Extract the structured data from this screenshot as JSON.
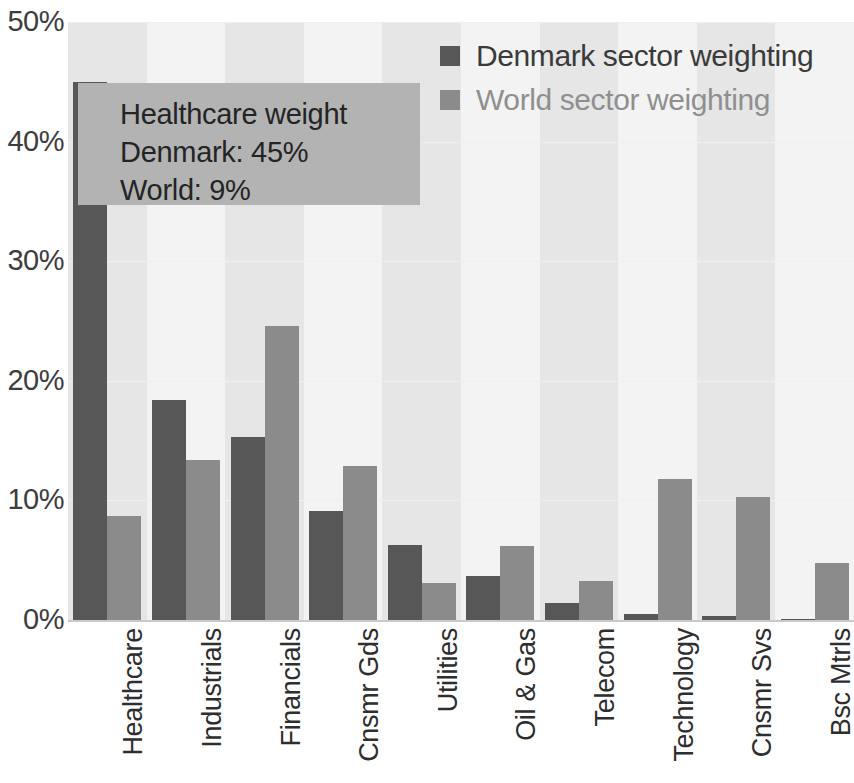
{
  "chart_data": {
    "type": "bar",
    "title": "",
    "xlabel": "",
    "ylabel": "",
    "ylim": [
      0,
      50
    ],
    "yticks": [
      "0%",
      "10%",
      "20%",
      "30%",
      "40%",
      "50%"
    ],
    "ytick_values": [
      0,
      10,
      20,
      30,
      40,
      50
    ],
    "grid": true,
    "legend_position": "top-right",
    "categories": [
      "Healthcare",
      "Industrials",
      "Financials",
      "Cnsmr Gds",
      "Utilities",
      "Oil & Gas",
      "Telecom",
      "Technology",
      "Cnsmr Svs",
      "Bsc Mtrls"
    ],
    "series": [
      {
        "name": "Denmark sector weighting",
        "color": "#575757",
        "values": [
          45.0,
          18.4,
          15.3,
          9.1,
          6.3,
          3.7,
          1.4,
          0.5,
          0.3,
          0.1
        ]
      },
      {
        "name": "World sector weighting",
        "color": "#8b8b8b",
        "values": [
          8.7,
          13.4,
          24.6,
          12.9,
          3.1,
          6.2,
          3.3,
          11.8,
          10.3,
          4.8
        ]
      }
    ],
    "annotation": {
      "lines": [
        "Healthcare weight",
        "Denmark: 45%",
        "World: 9%"
      ]
    }
  },
  "legend": {
    "items": [
      {
        "label": "Denmark sector weighting"
      },
      {
        "label": "World sector weighting"
      }
    ]
  }
}
